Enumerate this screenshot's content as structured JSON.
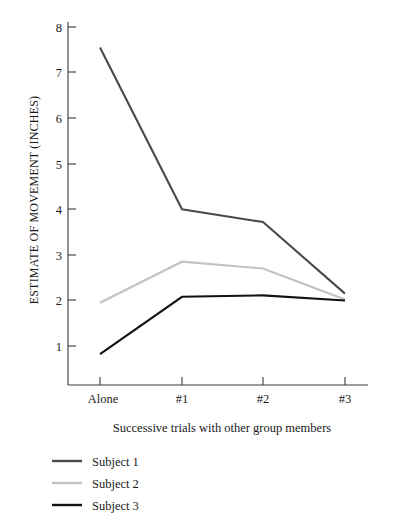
{
  "chart_data": {
    "type": "line",
    "title": "",
    "xlabel": "Successive trials with other group members",
    "ylabel": "ESTIMATE OF MOVEMENT (INCHES)",
    "categories": [
      "Alone",
      "#1",
      "#2",
      "#3"
    ],
    "ylim": [
      0,
      8.4
    ],
    "xlim": [
      0,
      3
    ],
    "yticks": [
      1,
      2,
      3,
      4,
      5,
      6,
      7,
      8
    ],
    "ytick_labels": [
      "1",
      "2",
      "3",
      "4",
      "5",
      "6",
      "7",
      "8"
    ],
    "grid": false,
    "legend_position": "below-left",
    "series": [
      {
        "name": "Subject 1",
        "color": "#4a4a4a",
        "values": [
          7.55,
          4.0,
          3.72,
          2.15
        ]
      },
      {
        "name": "Subject 2",
        "color": "#c2c2c2",
        "values": [
          1.95,
          2.85,
          2.7,
          2.02
        ]
      },
      {
        "name": "Subject 3",
        "color": "#121212",
        "values": [
          0.82,
          2.08,
          2.11,
          2.0
        ]
      }
    ]
  },
  "axis": {
    "y_title": "ESTIMATE OF MOVEMENT (INCHES)",
    "x_title": "Successive trials with other group members",
    "y_tick_1": "1",
    "y_tick_2": "2",
    "y_tick_3": "3",
    "y_tick_4": "4",
    "y_tick_5": "5",
    "y_tick_6": "6",
    "y_tick_7": "7",
    "y_tick_8": "8",
    "x_tick_0": "Alone",
    "x_tick_1": "#1",
    "x_tick_2": "#2",
    "x_tick_3": "#3"
  },
  "legend": {
    "entry_0": "Subject 1",
    "entry_1": "Subject 2",
    "entry_2": "Subject 3"
  }
}
